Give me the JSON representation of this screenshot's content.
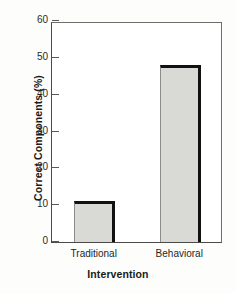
{
  "chart_data": {
    "type": "bar",
    "title": "",
    "xlabel": "Intervention",
    "ylabel": "Correct Components (%)",
    "categories": [
      "Traditional",
      "Behavioral"
    ],
    "values": [
      11,
      48
    ],
    "ylim": [
      0,
      60
    ],
    "yticks": [
      0,
      10,
      20,
      30,
      40,
      50,
      60
    ],
    "ytick_labels": [
      "0",
      "10",
      "20",
      "30",
      "40",
      "50",
      "60"
    ],
    "grid": false,
    "legend": null,
    "bar_fill_color": "#d9d9d5",
    "bar_edge_color": "#111111",
    "axis_color": "#4a4a48",
    "background_color": "#fdfdfb"
  }
}
